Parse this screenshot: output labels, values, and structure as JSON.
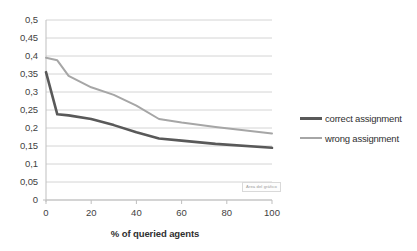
{
  "chart_data": {
    "type": "line",
    "title": "",
    "xlabel": "% of queried agents",
    "ylabel": "",
    "xlim": [
      0,
      100
    ],
    "ylim": [
      0,
      0.5
    ],
    "grid": true,
    "legend_position": "right",
    "x_tick_labels": [
      "0",
      "20",
      "40",
      "60",
      "80",
      "100"
    ],
    "x_ticks": [
      0,
      20,
      40,
      60,
      80,
      100
    ],
    "y_tick_labels": [
      "0",
      "0,05",
      "0,1",
      "0,15",
      "0,2",
      "0,25",
      "0,3",
      "0,35",
      "0,4",
      "0,45",
      "0,5"
    ],
    "y_ticks": [
      0,
      0.05,
      0.1,
      0.15,
      0.2,
      0.25,
      0.3,
      0.35,
      0.4,
      0.45,
      0.5
    ],
    "x": [
      0,
      5,
      10,
      20,
      30,
      40,
      50,
      60,
      75,
      100
    ],
    "series": [
      {
        "name": "correct assignment",
        "color": "#595959",
        "width": 2.6,
        "values": [
          0.355,
          0.238,
          0.235,
          0.225,
          0.208,
          0.188,
          0.171,
          0.165,
          0.156,
          0.145
        ]
      },
      {
        "name": "wrong assignment",
        "color": "#a6a6a6",
        "width": 2.0,
        "values": [
          0.395,
          0.388,
          0.345,
          0.313,
          0.292,
          0.262,
          0.225,
          0.215,
          0.203,
          0.185
        ]
      }
    ],
    "annotation": "Área del gráfico"
  },
  "axis": {
    "x_title": "% of queried agents"
  },
  "legend": {
    "items": [
      {
        "label": "correct assignment"
      },
      {
        "label": "wrong assignment"
      }
    ]
  },
  "colors": {
    "correct": "#595959",
    "wrong": "#a6a6a6",
    "gridline": "#c9c9c9",
    "axis": "#bfbfbf",
    "text": "#3f3f3f"
  }
}
